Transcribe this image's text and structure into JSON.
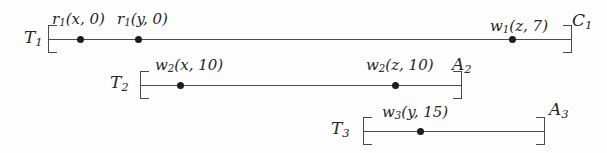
{
  "figure": {
    "kind": "transaction-schedule-timeline",
    "background_color": "#fdfdfd",
    "ink_color": "#4a4a4a",
    "dot_color": "#1d1d1d"
  },
  "timelines": [
    {
      "id": "T1",
      "name_base": "T",
      "name_sub": "1",
      "start_label": "T1",
      "end_label": "C1",
      "end_base": "C",
      "end_sub": "1",
      "axis": {
        "x": 48,
        "y": 39,
        "width": 524
      },
      "operations": [
        {
          "dot_x": 80,
          "label": "r1(x, 0)",
          "base": "r",
          "sub": "1",
          "args": "(x, 0)",
          "label_x": 52,
          "label_y": 12
        },
        {
          "dot_x": 138,
          "label": "r1(y, 0)",
          "base": "r",
          "sub": "1",
          "args": "(y, 0)",
          "label_x": 117,
          "label_y": 12
        },
        {
          "dot_x": 512,
          "label": "w1(z, 7)",
          "base": "w",
          "sub": "1",
          "args": "(z, 7)",
          "label_x": 490,
          "label_y": 19
        }
      ]
    },
    {
      "id": "T2",
      "name_base": "T",
      "name_sub": "2",
      "start_label": "T2",
      "end_label": "A2",
      "end_base": "A",
      "end_sub": "2",
      "axis": {
        "x": 140,
        "y": 85,
        "width": 322
      },
      "operations": [
        {
          "dot_x": 180,
          "label": "w2(x, 10)",
          "base": "w",
          "sub": "2",
          "args": "(x, 10)",
          "label_x": 155,
          "label_y": 58
        },
        {
          "dot_x": 395,
          "label": "w2(z, 10)",
          "base": "w",
          "sub": "2",
          "args": "(z, 10)",
          "label_x": 366,
          "label_y": 58
        }
      ]
    },
    {
      "id": "T3",
      "name_base": "T",
      "name_sub": "3",
      "start_label": "T3",
      "end_label": "A3",
      "end_base": "A",
      "end_sub": "3",
      "axis": {
        "x": 363,
        "y": 131,
        "width": 182
      },
      "operations": [
        {
          "dot_x": 420,
          "label": "w3(y, 15)",
          "base": "w",
          "sub": "3",
          "args": "(y, 15)",
          "label_x": 382,
          "label_y": 105
        }
      ]
    }
  ],
  "txn_labels": [
    {
      "base": "T",
      "sub": "1",
      "x": 24,
      "y": 29
    },
    {
      "base": "T",
      "sub": "2",
      "x": 110,
      "y": 74
    },
    {
      "base": "T",
      "sub": "3",
      "x": 331,
      "y": 120
    }
  ],
  "term_labels": [
    {
      "base": "C",
      "sub": "1",
      "x": 572,
      "y": 12
    },
    {
      "base": "A",
      "sub": "2",
      "x": 452,
      "y": 56
    },
    {
      "base": "A",
      "sub": "3",
      "x": 549,
      "y": 101
    }
  ]
}
